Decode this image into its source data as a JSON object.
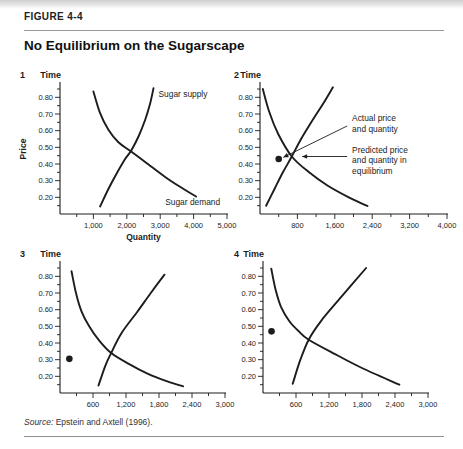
{
  "style": {
    "ink": "#1c1c1c",
    "rule": "#9a9a9a",
    "background": "#ffffff"
  },
  "figure": {
    "label": "FIGURE 4-4",
    "title": "No Equilibrium on the Sugarscape",
    "source_label": "Source:",
    "source_text": "Epstein and Axtell (1996)."
  },
  "chart_data": [
    {
      "type": "line",
      "number": "1",
      "time_label": "Time",
      "ylabel": "Price",
      "xlabel": "Quantity",
      "xlim": [
        0,
        5000
      ],
      "ylim": [
        0.1,
        0.88
      ],
      "x_ticks": [
        1000,
        2000,
        3000,
        4000,
        5000
      ],
      "x_tick_labels": [
        "1,000",
        "2,000",
        "3,000",
        "4,000",
        "5,000"
      ],
      "x_minor_step": 500,
      "y_ticks": [
        0.2,
        0.3,
        0.4,
        0.5,
        0.6,
        0.7,
        0.8
      ],
      "y_tick_labels": [
        "0.20",
        "0.30",
        "0.40",
        "0.50",
        "0.60",
        "0.70",
        "0.80"
      ],
      "y_minor_step": 0.05,
      "series": [
        {
          "name": "Sugar demand",
          "points": [
            [
              1000,
              0.835
            ],
            [
              1200,
              0.705
            ],
            [
              1450,
              0.605
            ],
            [
              1750,
              0.53
            ],
            [
              2130,
              0.475
            ],
            [
              2600,
              0.405
            ],
            [
              3200,
              0.315
            ],
            [
              3700,
              0.25
            ],
            [
              4075,
              0.205
            ]
          ]
        },
        {
          "name": "Sugar supply",
          "points": [
            [
              1200,
              0.145
            ],
            [
              1450,
              0.25
            ],
            [
              1700,
              0.345
            ],
            [
              1950,
              0.43
            ],
            [
              2130,
              0.48
            ],
            [
              2350,
              0.565
            ],
            [
              2550,
              0.665
            ],
            [
              2700,
              0.765
            ],
            [
              2800,
              0.855
            ]
          ]
        }
      ],
      "curve_labels": [
        {
          "text": "Sugar supply",
          "at": [
            2950,
            0.82
          ]
        },
        {
          "text": "Sugar demand",
          "at": [
            3150,
            0.17
          ]
        }
      ],
      "dot": null,
      "annotations": []
    },
    {
      "type": "line",
      "number": "2",
      "time_label": "Time",
      "ylabel": null,
      "xlabel": null,
      "xlim": [
        0,
        4000
      ],
      "ylim": [
        0.1,
        0.88
      ],
      "x_ticks": [
        800,
        1600,
        2400,
        3200,
        4000
      ],
      "x_tick_labels": [
        "800",
        "1,600",
        "2,400",
        "3,200",
        "4,000"
      ],
      "x_minor_step": 400,
      "y_ticks": [
        0.2,
        0.3,
        0.4,
        0.5,
        0.6,
        0.7,
        0.8
      ],
      "y_tick_labels": [
        "0.20",
        "0.30",
        "0.40",
        "0.50",
        "0.60",
        "0.70",
        "0.80"
      ],
      "y_minor_step": 0.05,
      "series": [
        {
          "name": "Sugar demand",
          "points": [
            [
              60,
              0.85
            ],
            [
              200,
              0.71
            ],
            [
              390,
              0.58
            ],
            [
              680,
              0.445
            ],
            [
              1050,
              0.35
            ],
            [
              1450,
              0.27
            ],
            [
              1900,
              0.2
            ],
            [
              2300,
              0.148
            ]
          ]
        },
        {
          "name": "Sugar supply",
          "points": [
            [
              130,
              0.15
            ],
            [
              310,
              0.25
            ],
            [
              490,
              0.35
            ],
            [
              680,
              0.445
            ],
            [
              880,
              0.55
            ],
            [
              1130,
              0.665
            ],
            [
              1380,
              0.775
            ],
            [
              1560,
              0.86
            ]
          ]
        }
      ],
      "curve_labels": [],
      "dot": [
        400,
        0.43
      ],
      "annotations": [
        {
          "kind": "diagonal",
          "lines": [
            "Actual price",
            "and quantity"
          ],
          "text_at": [
            1970,
            0.7
          ],
          "tip": [
            500,
            0.44
          ]
        },
        {
          "kind": "horizontal",
          "lines": [
            "Predicted price",
            "and quantity in",
            "equilibrium"
          ],
          "text_at": [
            1970,
            0.51
          ],
          "tip": [
            900,
            0.445
          ]
        }
      ]
    },
    {
      "type": "line",
      "number": "3",
      "time_label": "Time",
      "ylabel": null,
      "xlabel": null,
      "xlim": [
        0,
        3000
      ],
      "ylim": [
        0.1,
        0.88
      ],
      "x_ticks": [
        600,
        1200,
        1800,
        2400,
        3000
      ],
      "x_tick_labels": [
        "600",
        "1,200",
        "1,800",
        "2,400",
        "3,000"
      ],
      "x_minor_step": 300,
      "y_ticks": [
        0.2,
        0.3,
        0.4,
        0.5,
        0.6,
        0.7,
        0.8
      ],
      "y_tick_labels": [
        "0.20",
        "0.30",
        "0.40",
        "0.50",
        "0.60",
        "0.70",
        "0.80"
      ],
      "y_minor_step": 0.05,
      "series": [
        {
          "name": "Sugar demand",
          "points": [
            [
              210,
              0.83
            ],
            [
              290,
              0.7
            ],
            [
              390,
              0.59
            ],
            [
              530,
              0.5
            ],
            [
              700,
              0.42
            ],
            [
              930,
              0.34
            ],
            [
              1250,
              0.275
            ],
            [
              1600,
              0.215
            ],
            [
              1950,
              0.17
            ],
            [
              2240,
              0.14
            ]
          ]
        },
        {
          "name": "Sugar supply",
          "points": [
            [
              700,
              0.145
            ],
            [
              820,
              0.26
            ],
            [
              930,
              0.34
            ],
            [
              1120,
              0.46
            ],
            [
              1400,
              0.585
            ],
            [
              1650,
              0.7
            ],
            [
              1900,
              0.81
            ]
          ]
        }
      ],
      "curve_labels": [],
      "dot": [
        170,
        0.305
      ],
      "annotations": []
    },
    {
      "type": "line",
      "number": "4",
      "time_label": "Time",
      "ylabel": null,
      "xlabel": null,
      "xlim": [
        0,
        3000
      ],
      "ylim": [
        0.1,
        0.88
      ],
      "x_ticks": [
        600,
        1200,
        1800,
        2400,
        3000
      ],
      "x_tick_labels": [
        "600",
        "1,200",
        "1,800",
        "2,400",
        "3,000"
      ],
      "x_minor_step": 300,
      "y_ticks": [
        0.2,
        0.3,
        0.4,
        0.5,
        0.6,
        0.7,
        0.8
      ],
      "y_tick_labels": [
        "0.20",
        "0.30",
        "0.40",
        "0.50",
        "0.60",
        "0.70",
        "0.80"
      ],
      "y_minor_step": 0.05,
      "series": [
        {
          "name": "Sugar demand",
          "points": [
            [
              150,
              0.845
            ],
            [
              230,
              0.72
            ],
            [
              330,
              0.615
            ],
            [
              480,
              0.53
            ],
            [
              650,
              0.47
            ],
            [
              830,
              0.42
            ],
            [
              1300,
              0.335
            ],
            [
              1800,
              0.25
            ],
            [
              2480,
              0.15
            ]
          ]
        },
        {
          "name": "Sugar supply",
          "points": [
            [
              540,
              0.155
            ],
            [
              680,
              0.3
            ],
            [
              830,
              0.42
            ],
            [
              1050,
              0.53
            ],
            [
              1380,
              0.66
            ],
            [
              1875,
              0.85
            ]
          ]
        }
      ],
      "curve_labels": [],
      "dot": [
        155,
        0.47
      ],
      "annotations": []
    }
  ]
}
